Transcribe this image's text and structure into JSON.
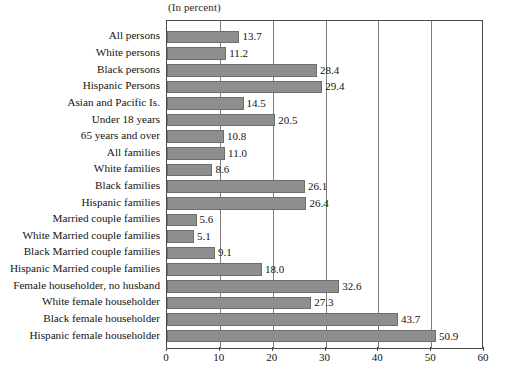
{
  "chart_data": {
    "type": "bar",
    "orientation": "horizontal",
    "title": "(In percent)",
    "xlabel": "",
    "ylabel": "",
    "xlim": [
      0,
      60
    ],
    "xticks": [
      0,
      10,
      20,
      30,
      40,
      50,
      60
    ],
    "grid": true,
    "gridlines_axis": "x",
    "legend": null,
    "bar_color": "#8e8e8e",
    "bar_edge_color": "#6d6d6d",
    "categories": [
      "All persons",
      "White persons",
      "Black persons",
      "Hispanic Persons",
      "Asian and Pacific Is.",
      "Under 18 years",
      "65 years and over",
      "All families",
      "White families",
      "Black families",
      "Hispanic families",
      "Married couple families",
      "White Married couple families",
      "Black Married couple families",
      "Hispanic Married couple families",
      "Female householder, no husband",
      "White female householder",
      "Black female householder",
      "Hispanic female householder"
    ],
    "values": [
      13.7,
      11.2,
      28.4,
      29.4,
      14.5,
      20.5,
      10.8,
      11.0,
      8.6,
      26.1,
      26.4,
      5.6,
      5.1,
      9.1,
      18.0,
      32.6,
      27.3,
      43.7,
      50.9
    ],
    "value_labels": [
      "13.7",
      "11.2",
      "28.4",
      "29.4",
      "14.5",
      "20.5",
      "10.8",
      "11.0",
      "8.6",
      "26.1",
      "26.4",
      "5.6",
      "5.1",
      "9.1",
      "18.0",
      "32.6",
      "27.3",
      "43.7",
      "50.9"
    ],
    "xtick_labels": [
      "0",
      "10",
      "20",
      "30",
      "40",
      "50",
      "60"
    ]
  }
}
